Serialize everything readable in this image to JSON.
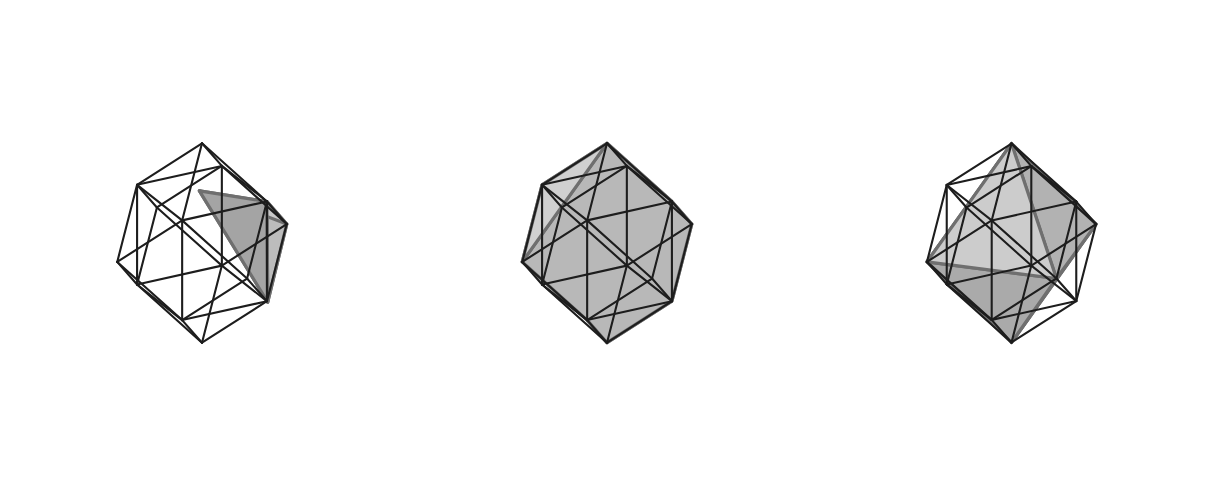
{
  "figure": {
    "name": "three-rhombic-dodecahedron-cages",
    "width": 1216,
    "height": 485,
    "background": "#ffffff",
    "cage_edge_color": "#1d1d1d",
    "cage_edge_width": 2.1,
    "panel_count": 3
  },
  "palette": {
    "fill_light": "#c6c6c6",
    "fill_mid": "#b4b4b4",
    "fill_dark": "#a0a0a0",
    "fill_darker": "#909090",
    "edge_solid": "#6f6f6f",
    "edge_solid_dark": "#5a5a5a",
    "cage": "#1d1d1d"
  },
  "projection": {
    "note": "orthographic projection of a rhombic dodecahedron (unit cube with six square pyramids) viewed from above-left",
    "scale": 96,
    "yaw_deg": -28,
    "pitch_deg": 22,
    "vertical_stretch": 1.12,
    "apex_height": 0.5,
    "centers": [
      {
        "cx": 196,
        "cy": 243
      },
      {
        "cx": 601,
        "cy": 243
      },
      {
        "cx": 1010,
        "cy": 243
      }
    ]
  },
  "cage": {
    "label": "rhombic-dodecahedron-wireframe",
    "cube_vertices": [
      [
        -0.5,
        -0.5,
        -0.5
      ],
      [
        0.5,
        -0.5,
        -0.5
      ],
      [
        0.5,
        0.5,
        -0.5
      ],
      [
        -0.5,
        0.5,
        -0.5
      ],
      [
        -0.5,
        -0.5,
        0.5
      ],
      [
        0.5,
        -0.5,
        0.5
      ],
      [
        0.5,
        0.5,
        0.5
      ],
      [
        -0.5,
        0.5,
        0.5
      ]
    ],
    "apex_vertices": [
      [
        0,
        0,
        1.0
      ],
      [
        0,
        0,
        -1.0
      ],
      [
        1.0,
        0,
        0
      ],
      [
        -1.0,
        0,
        0
      ],
      [
        0,
        1.0,
        0
      ],
      [
        0,
        -1.0,
        0
      ]
    ],
    "cube_edges": [
      [
        0,
        1
      ],
      [
        1,
        2
      ],
      [
        2,
        3
      ],
      [
        3,
        0
      ],
      [
        4,
        5
      ],
      [
        5,
        6
      ],
      [
        6,
        7
      ],
      [
        7,
        4
      ],
      [
        0,
        4
      ],
      [
        1,
        5
      ],
      [
        2,
        6
      ],
      [
        3,
        7
      ]
    ],
    "apex_edges": [
      [
        8,
        4
      ],
      [
        8,
        5
      ],
      [
        8,
        6
      ],
      [
        8,
        7
      ],
      [
        9,
        0
      ],
      [
        9,
        1
      ],
      [
        9,
        2
      ],
      [
        9,
        3
      ],
      [
        10,
        1
      ],
      [
        10,
        2
      ],
      [
        10,
        5
      ],
      [
        10,
        6
      ],
      [
        11,
        0
      ],
      [
        11,
        3
      ],
      [
        11,
        4
      ],
      [
        11,
        7
      ],
      [
        12,
        2
      ],
      [
        12,
        3
      ],
      [
        12,
        6
      ],
      [
        12,
        7
      ],
      [
        13,
        0
      ],
      [
        13,
        1
      ],
      [
        13,
        4
      ],
      [
        13,
        5
      ]
    ]
  },
  "panels": [
    {
      "id": "panel-1",
      "label": "tetrahedron-inscribed",
      "solid_name": "tetrahedron",
      "description": "small shaded tetrahedron occupying the upper-right octant of the cage",
      "vertices": [
        [
          0.5,
          0.5,
          0.5
        ],
        [
          -0.02,
          -0.02,
          0.52
        ],
        [
          1.0,
          0.0,
          0.0
        ],
        [
          0.52,
          0.48,
          -0.52
        ]
      ],
      "faces": [
        {
          "indices": [
            0,
            1,
            2
          ],
          "shade": "#c9c9c9"
        },
        {
          "indices": [
            1,
            2,
            3
          ],
          "shade": "#b0b0b0"
        },
        {
          "indices": [
            0,
            2,
            3
          ],
          "shade": "#bcbcbc"
        },
        {
          "indices": [
            0,
            1,
            3
          ],
          "shade": "#a4a4a4"
        }
      ]
    },
    {
      "id": "panel-2",
      "label": "truncated-solid-inscribed",
      "solid_name": "truncated-polyhedron",
      "description": "large shaded polyhedron filling most of the cage, slanted from upper-left to lower-right",
      "vertices": [
        [
          -0.5,
          -0.5,
          0.5
        ],
        [
          0.0,
          0.0,
          1.0
        ],
        [
          0.5,
          0.5,
          0.5
        ],
        [
          1.0,
          0.0,
          0.0
        ],
        [
          0.5,
          -0.5,
          -0.5
        ],
        [
          0.0,
          -1.0,
          0.0
        ],
        [
          -1.0,
          0.0,
          0.0
        ],
        [
          -0.5,
          0.5,
          -0.5
        ],
        [
          0.0,
          0.0,
          -1.0
        ],
        [
          0.5,
          0.5,
          -0.5
        ]
      ],
      "faces": [
        {
          "indices": [
            0,
            1,
            2,
            3,
            4,
            5
          ],
          "shade": "#c2c2c2"
        },
        {
          "indices": [
            0,
            5,
            4,
            8,
            7,
            6
          ],
          "shade": "#acacac"
        },
        {
          "indices": [
            2,
            3,
            9,
            8,
            7,
            6,
            1
          ],
          "shade": "#b8b8b8"
        },
        {
          "indices": [
            3,
            4,
            8,
            9
          ],
          "shade": "#9d9d9d"
        },
        {
          "indices": [
            0,
            6,
            1
          ],
          "shade": "#d0d0d0"
        }
      ]
    },
    {
      "id": "panel-3",
      "label": "stellated-solid-inscribed",
      "solid_name": "stellated-octahedron",
      "description": "shaded solid spanning the cage diagonally from the top apex to the bottom apex",
      "vertices": [
        [
          0.0,
          0.0,
          1.0
        ],
        [
          -1.0,
          0.0,
          0.0
        ],
        [
          1.0,
          0.0,
          0.0
        ],
        [
          0.0,
          0.0,
          -1.0
        ],
        [
          0.0,
          -1.0,
          0.0
        ],
        [
          0.0,
          1.0,
          0.0
        ],
        [
          -0.5,
          -0.5,
          0.5
        ],
        [
          0.5,
          0.5,
          -0.5
        ]
      ],
      "faces": [
        {
          "indices": [
            0,
            1,
            4
          ],
          "shade": "#c7c7c7"
        },
        {
          "indices": [
            0,
            4,
            2
          ],
          "shade": "#bdbdbd"
        },
        {
          "indices": [
            0,
            2,
            5
          ],
          "shade": "#b2b2b2"
        },
        {
          "indices": [
            0,
            5,
            1
          ],
          "shade": "#cccccc"
        },
        {
          "indices": [
            3,
            1,
            4
          ],
          "shade": "#a6a6a6"
        },
        {
          "indices": [
            3,
            4,
            2
          ],
          "shade": "#9c9c9c"
        },
        {
          "indices": [
            3,
            2,
            5
          ],
          "shade": "#a0a0a0"
        },
        {
          "indices": [
            3,
            5,
            1
          ],
          "shade": "#aaaaaa"
        }
      ]
    }
  ]
}
